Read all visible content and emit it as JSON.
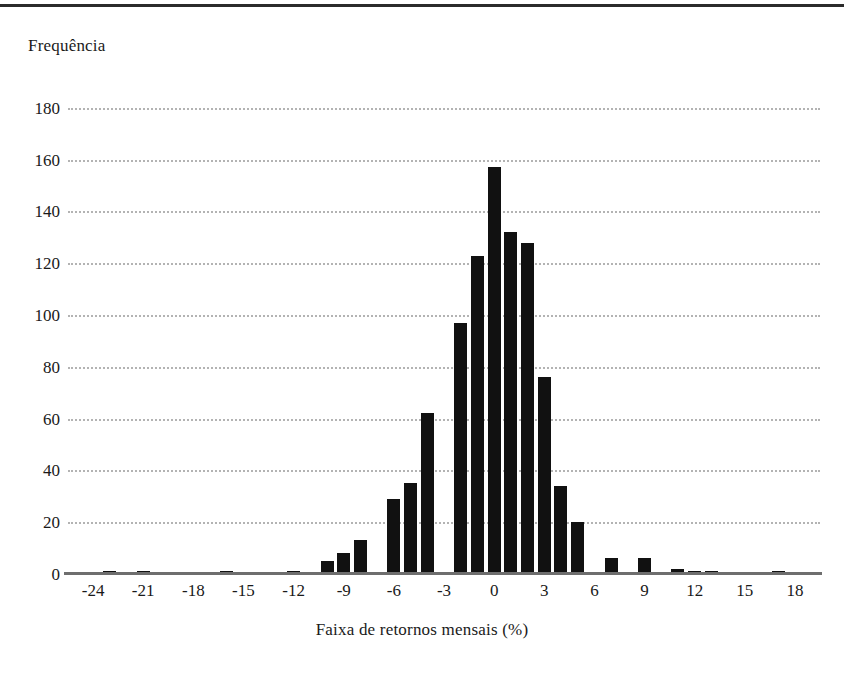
{
  "chart_data": {
    "type": "bar",
    "title": "",
    "xlabel": "Faixa de retornos mensais (%)",
    "ylabel": "Frequência",
    "xlim": [
      -25.5,
      19.5
    ],
    "ylim": [
      0,
      190
    ],
    "grid": true,
    "legend": false,
    "bar_color": "#111111",
    "grid_color": "#b3b3b3",
    "axis_color": "#6e6e6e",
    "ytick_labels": [
      "0",
      "20",
      "40",
      "60",
      "80",
      "100",
      "120",
      "140",
      "160",
      "180"
    ],
    "ytick_values": [
      0,
      20,
      40,
      60,
      80,
      100,
      120,
      140,
      160,
      180
    ],
    "xtick_labels": [
      "-24",
      "-21",
      "-18",
      "-15",
      "-12",
      "-9",
      "-6",
      "-3",
      "0",
      "3",
      "6",
      "9",
      "12",
      "15",
      "18"
    ],
    "xtick_values": [
      -24,
      -21,
      -18,
      -15,
      -12,
      -9,
      -6,
      -3,
      0,
      3,
      6,
      9,
      12,
      15,
      18
    ],
    "bin_width": 1,
    "categories": [
      -23,
      -21,
      -16,
      -12,
      -10,
      -9,
      -8,
      -6,
      -5,
      -4,
      -2,
      -1,
      0,
      1,
      2,
      3,
      4,
      5,
      7,
      9,
      11,
      12,
      13,
      17
    ],
    "values": [
      1,
      1,
      1,
      1,
      5,
      8,
      13,
      29,
      35,
      62,
      97,
      123,
      157,
      132,
      128,
      76,
      34,
      20,
      6,
      6,
      2,
      1,
      1,
      1
    ],
    "peak_value": 157,
    "peak_category": 0
  }
}
